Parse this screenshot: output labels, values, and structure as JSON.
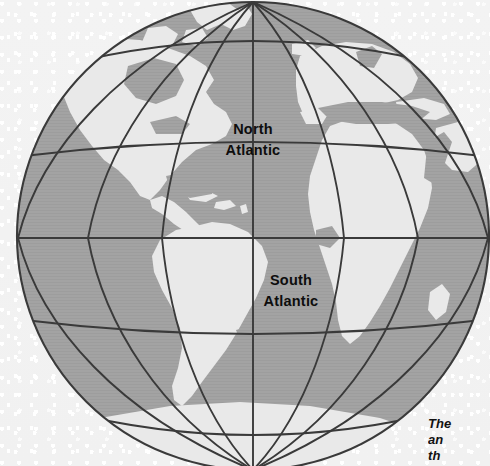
{
  "figure": {
    "type": "globe-map",
    "projection": "globular",
    "center_label": "Atlantic Ocean",
    "background_color": "#f2f2f2",
    "ocean_color": "#a3a3a3",
    "land_color": "#e9e9e9",
    "graticule_color": "#3a3a3a",
    "limb_color": "#3a3a3a",
    "label_color": "#0d0d0d"
  },
  "labels": {
    "north_atlantic": {
      "line1": "North",
      "line2": "Atlantic",
      "x": 253,
      "y": 132
    },
    "south_atlantic": {
      "line1": "South",
      "line2": "Atlantic",
      "x": 290,
      "y": 283
    }
  },
  "caption": {
    "line1": "The",
    "line2": "an",
    "line3": "th"
  },
  "graticule": {
    "pole_north": {
      "x": 253,
      "y": 2
    },
    "pole_south": {
      "x": 253,
      "y": 470
    },
    "equator_y": 238,
    "parallels_y": [
      60,
      150,
      238,
      318,
      392
    ],
    "meridian_count": 7,
    "limb_left_x": 18,
    "limb_right_x": 489
  }
}
